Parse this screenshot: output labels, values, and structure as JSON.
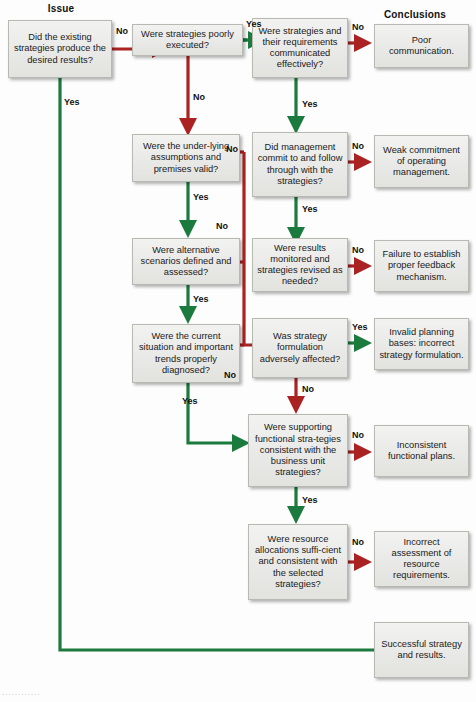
{
  "diagram": {
    "headers": {
      "issue": "Issue",
      "conclusions": "Conclusions"
    },
    "nodes": [
      {
        "id": "q1",
        "text": "Did the existing strategies produce the desired results?"
      },
      {
        "id": "q2",
        "text": "Were strategies poorly executed?"
      },
      {
        "id": "q3",
        "text": "Were strategies and their requirements communicated effectively?"
      },
      {
        "id": "c1",
        "text": "Poor communication."
      },
      {
        "id": "q4",
        "text": "Were the under-lying assumptions and premises valid?"
      },
      {
        "id": "q5",
        "text": "Did management commit to and follow through with the strategies?"
      },
      {
        "id": "c2",
        "text": "Weak commitment of operating management."
      },
      {
        "id": "q6",
        "text": "Were alternative scenarios defined and assessed?"
      },
      {
        "id": "q7",
        "text": "Were results monitored and strategies revised as needed?"
      },
      {
        "id": "c3",
        "text": "Failure to establish proper feedback mechanism."
      },
      {
        "id": "q8",
        "text": "Were the current situation and important trends properly diagnosed?"
      },
      {
        "id": "q9",
        "text": "Was strategy formulation adversely affected?"
      },
      {
        "id": "c4",
        "text": "Invalid planning bases: incorrect strategy formulation."
      },
      {
        "id": "q10",
        "text": "Were supporting functional stra-tegies consistent with the business unit strategies?"
      },
      {
        "id": "c5",
        "text": "Inconsistent functional plans."
      },
      {
        "id": "q11",
        "text": "Were resource allocations suffi-cient and consistent with the selected strategies?"
      },
      {
        "id": "c6",
        "text": "Incorrect assessment of resource requirements."
      },
      {
        "id": "c7",
        "text": "Successful strategy and results."
      }
    ],
    "edge_labels": {
      "q1_no": "No",
      "q1_yes": "Yes",
      "q2_yes": "Yes",
      "q2_no": "No",
      "q3_no": "No",
      "q3_yes": "Yes",
      "q4_no": "No",
      "q4_yes": "Yes",
      "q5_no": "No",
      "q5_yes": "Yes",
      "q6_no": "No",
      "q6_yes": "Yes",
      "q7_no": "No",
      "q8_no": "No",
      "q8_yes": "Yes",
      "q9_yes": "Yes",
      "q9_no": "No",
      "q10_no": "No",
      "q10_yes": "Yes",
      "q11_no": "No"
    },
    "colors": {
      "yes_branch": "#1b7a3d",
      "no_branch": "#aa2222",
      "box_fill": "#eaeae8",
      "box_border": "#b9b9b4",
      "text": "#1a1a1a"
    },
    "footer_marks": "............"
  }
}
